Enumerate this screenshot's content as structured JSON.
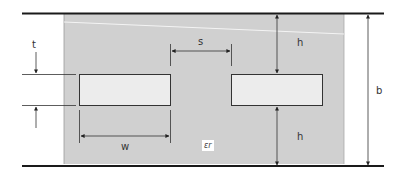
{
  "figure": {
    "type": "edge-coupled stripline cross-section",
    "colors": {
      "dielectric": "#cfcfcf",
      "strip": "#ececec",
      "ground_plane": "#1a1a1a",
      "dimension_line": "#333333"
    },
    "labels": {
      "t": "t",
      "s": "s",
      "h_top": "h",
      "h_bottom": "h",
      "w": "w",
      "b": "b",
      "er": "εr"
    },
    "dimensions": {
      "t_desc": "strip thickness",
      "s_desc": "strip spacing",
      "h_desc": "strip to ground distance",
      "w_desc": "strip width",
      "b_desc": "ground plane separation",
      "er_desc": "relative permittivity"
    }
  }
}
